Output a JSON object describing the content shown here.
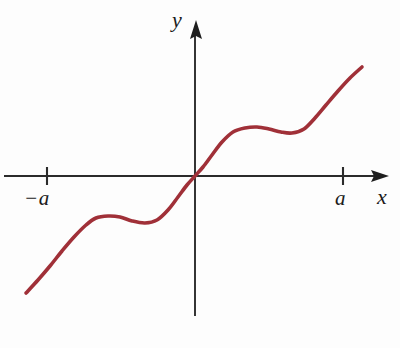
{
  "figure": {
    "title": "",
    "background_color": "#fdfdfd",
    "axis_color": "#2b2b2b",
    "curve_color": "#a03038"
  },
  "axes": {
    "x_axis": {
      "label": "x",
      "label_name": "x-axis-label",
      "line_y": 176,
      "x_start": 4,
      "x_end": 389,
      "arrow": "right"
    },
    "y_axis": {
      "label": "y",
      "label_name": "y-axis-label",
      "line_x": 195,
      "y_start": 20,
      "y_end": 316,
      "arrow": "up"
    },
    "origin": {
      "x": 195,
      "y": 176
    }
  },
  "ticks": [
    {
      "name": "tick-neg-a",
      "label": "−a",
      "x": 47,
      "y": 176,
      "half_height": 9
    },
    {
      "name": "tick-pos-a",
      "label": "a",
      "x": 343,
      "y": 176,
      "half_height": 9
    }
  ],
  "chart_data": {
    "type": "line",
    "title": "",
    "xlabel": "x",
    "ylabel": "y",
    "grid": false,
    "legend": null,
    "axis_ticks": {
      "x": [
        "−a",
        "a"
      ],
      "y": []
    },
    "annotations": [],
    "series": [
      {
        "name": "f(x)",
        "description": "Odd, increasing S-shaped curve through the origin with a local maximum and local minimum on each side",
        "stroke_color": "#a03038",
        "stroke_width": 3.6,
        "points_pixels": [
          [
            26,
            293
          ],
          [
            38,
            280
          ],
          [
            50,
            266
          ],
          [
            62,
            251
          ],
          [
            74,
            237
          ],
          [
            86,
            225
          ],
          [
            96,
            218
          ],
          [
            108,
            216
          ],
          [
            120,
            217
          ],
          [
            132,
            221
          ],
          [
            145,
            223
          ],
          [
            157,
            220
          ],
          [
            168,
            210
          ],
          [
            178,
            197
          ],
          [
            187,
            185
          ],
          [
            195,
            176
          ],
          [
            203,
            167
          ],
          [
            212,
            155
          ],
          [
            222,
            142
          ],
          [
            233,
            132
          ],
          [
            245,
            128
          ],
          [
            257,
            127
          ],
          [
            269,
            129
          ],
          [
            281,
            132
          ],
          [
            292,
            133
          ],
          [
            304,
            129
          ],
          [
            315,
            118
          ],
          [
            326,
            105
          ],
          [
            338,
            91
          ],
          [
            350,
            78
          ],
          [
            362,
            67
          ]
        ],
        "key_points": {
          "left_endpoint": [
            26,
            293
          ],
          "local_max_left": [
            96,
            218
          ],
          "local_min_left": [
            145,
            223
          ],
          "origin_crossing": [
            195,
            176
          ],
          "local_max_right": [
            245,
            128
          ],
          "local_min_right": [
            292,
            133
          ],
          "right_endpoint": [
            362,
            67
          ]
        }
      }
    ]
  }
}
